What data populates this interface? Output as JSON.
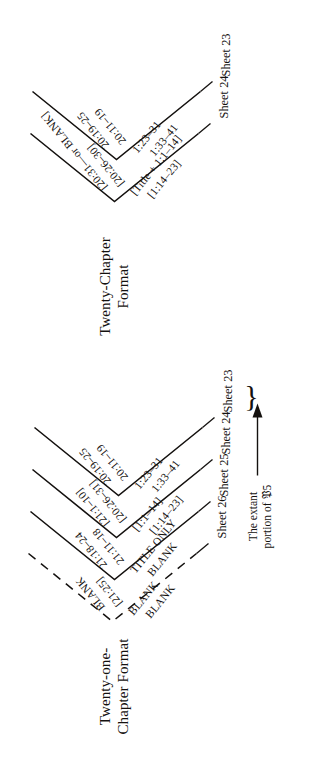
{
  "figure": {
    "orientation": "rotated-90-ccw",
    "ink_color": "#14110f"
  },
  "panels": [
    {
      "id": "twenty-one-chapter",
      "title": "Twenty-one-\nChapter Format",
      "sheets": [
        {
          "name": "Sheet 26",
          "upper_outer": "BLANK",
          "upper_inner": "[21:25]",
          "lower_inner": "BLANK",
          "lower_outer": "BLANK",
          "dashed": true
        },
        {
          "name": "Sheet 25",
          "upper_outer": "21:18–24",
          "upper_inner": "21:11–18",
          "lower_inner": "TITLE ONLY",
          "lower_outer": "BLANK",
          "dashed": false
        },
        {
          "name": "Sheet 24",
          "upper_outer": "[21:1–10]",
          "upper_inner": "[20:26–31]",
          "lower_inner": "[1:1–14]",
          "lower_outer": "[1:14–23]",
          "dashed": false
        },
        {
          "name": "Sheet 23",
          "upper_outer": "20:19–25",
          "upper_inner": "20:11–19",
          "lower_inner": "1:23–31",
          "lower_outer": "1:33–41",
          "dashed": false
        }
      ]
    },
    {
      "id": "twenty-chapter",
      "title": "Twenty-Chapter\nFormat",
      "sheets": [
        {
          "name": "Sheet 24",
          "upper_outer": "[20:31—or BLANK]",
          "upper_inner": "[20:26–30]",
          "lower_inner": "[Title + 1:1–14]",
          "lower_outer": "[1:14–23]",
          "dashed": false
        },
        {
          "name": "Sheet 23",
          "upper_outer": "20:19–25",
          "upper_inner": "20:11–19",
          "lower_inner": "1:23–31",
          "lower_outer": "1:33–41",
          "dashed": false
        }
      ]
    }
  ],
  "annotation": {
    "text": "The extant\nportion of 𝔓5",
    "brace_glyph": "}",
    "arrow_glyph": "↑"
  }
}
